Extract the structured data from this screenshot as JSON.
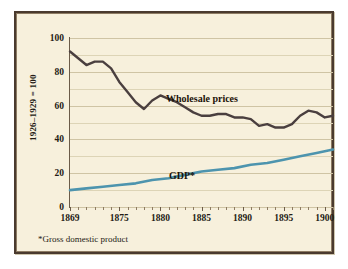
{
  "figure": {
    "background_color": "#f7f0dc",
    "frame_color": "#4a3a2e",
    "footnote": "*Gross domestic product"
  },
  "chart_data": {
    "type": "line",
    "title": "",
    "subtitle": "",
    "xlabel": "",
    "ylabel": "1926–1929 = 100",
    "xlim": [
      1869,
      1901
    ],
    "ylim": [
      0,
      100
    ],
    "grid": true,
    "grid_values": [
      0,
      10,
      20,
      30,
      40,
      50,
      60,
      70,
      80,
      90,
      100
    ],
    "legend_position": "inline-annotation",
    "ytick_labels": [
      "0",
      "20",
      "40",
      "60",
      "80",
      "100"
    ],
    "ytick_values": [
      0,
      20,
      40,
      60,
      80,
      100
    ],
    "xtick_labels": [
      "1869",
      "1875",
      "1880",
      "1885",
      "1890",
      "1895",
      "1900"
    ],
    "xtick_values": [
      1869,
      1875,
      1880,
      1885,
      1890,
      1895,
      1900
    ],
    "series": [
      {
        "name": "Wholesale prices",
        "color": "#4a3f3f",
        "label_text": "Wholesale prices",
        "x": [
          1869,
          1870,
          1871,
          1872,
          1873,
          1874,
          1875,
          1876,
          1877,
          1878,
          1879,
          1880,
          1881,
          1882,
          1883,
          1884,
          1885,
          1886,
          1887,
          1888,
          1889,
          1890,
          1891,
          1892,
          1893,
          1894,
          1895,
          1896,
          1897,
          1898,
          1899,
          1900,
          1901
        ],
        "values": [
          92,
          88,
          84,
          86,
          86,
          82,
          74,
          68,
          62,
          58,
          63,
          66,
          64,
          62,
          59,
          56,
          54,
          54,
          55,
          55,
          53,
          53,
          52,
          48,
          49,
          47,
          47,
          49,
          54,
          57,
          56,
          53,
          54
        ]
      },
      {
        "name": "GDP*",
        "color": "#4d94ae",
        "label_text": "GDP*",
        "x": [
          1869,
          1871,
          1873,
          1875,
          1877,
          1879,
          1881,
          1883,
          1885,
          1887,
          1889,
          1891,
          1893,
          1895,
          1897,
          1899,
          1901
        ],
        "values": [
          10,
          11,
          12,
          13,
          14,
          16,
          17,
          19,
          21,
          22,
          23,
          25,
          26,
          28,
          30,
          32,
          34
        ]
      }
    ],
    "annotations": [
      {
        "text": "Wholesale prices",
        "x": 1881,
        "y": 68
      },
      {
        "text": "GDP*",
        "x": 1882,
        "y": 27
      }
    ]
  }
}
